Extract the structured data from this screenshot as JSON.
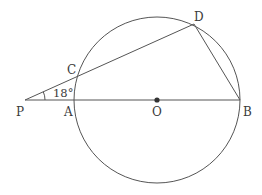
{
  "diagram": {
    "type": "geometry",
    "colors": {
      "stroke": "#555555",
      "text": "#3a3a3a",
      "background": "#ffffff"
    },
    "circle": {
      "center_label": "O",
      "cx": 157,
      "cy": 100,
      "r": 83
    },
    "points": {
      "P": {
        "label": "P",
        "x": 25,
        "y": 100
      },
      "A": {
        "label": "A",
        "x": 74,
        "y": 100
      },
      "O": {
        "label": "O",
        "x": 157,
        "y": 100
      },
      "B": {
        "label": "B",
        "x": 240,
        "y": 100
      },
      "C": {
        "label": "C",
        "x": 78,
        "y": 76
      },
      "D": {
        "label": "D",
        "x": 194,
        "y": 24
      }
    },
    "segments": [
      {
        "from": "P",
        "to": "B"
      },
      {
        "from": "P",
        "to": "D"
      },
      {
        "from": "D",
        "to": "B"
      }
    ],
    "angle": {
      "vertex": "P",
      "label": "18°",
      "value_deg": 18
    }
  }
}
